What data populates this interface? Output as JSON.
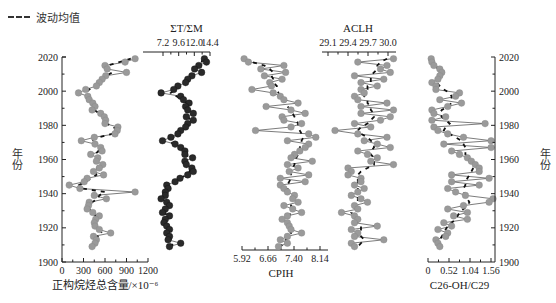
{
  "legend": {
    "label": "波动均值",
    "icon": "dashed-line-icon"
  },
  "y_axis": {
    "label": "年份",
    "ticks": [
      "2020",
      "2000",
      "1980",
      "1960",
      "1940",
      "1920",
      "1900"
    ]
  },
  "panels": [
    {
      "id": "p1",
      "xlabel": "正构烷烃总含量/×10⁻⁶",
      "ticks": [
        "0",
        "300",
        "600",
        "900",
        "1200"
      ],
      "axis_pos": "bottom",
      "color": "#9a9a9a"
    },
    {
      "id": "p2",
      "xlabel": "ΣT/ΣM",
      "ticks": [
        "7.2",
        "9.6",
        "12.0",
        "14.4"
      ],
      "axis_pos": "top",
      "color": "#2a2a2a"
    },
    {
      "id": "p3",
      "xlabel": "CPIH",
      "ticks": [
        "5.92",
        "6.66",
        "7.40",
        "8.14"
      ],
      "axis_pos": "bottom",
      "color": "#9a9a9a"
    },
    {
      "id": "p4",
      "xlabel": "ACLH",
      "ticks": [
        "29.1",
        "29.4",
        "29.7",
        "30.0"
      ],
      "axis_pos": "top",
      "color": "#9a9a9a"
    },
    {
      "id": "p5",
      "xlabel": "C26-OH/C29",
      "ticks": [
        "0",
        "0.52",
        "1.04",
        "1.56"
      ],
      "axis_pos": "bottom",
      "color": "#9a9a9a"
    }
  ],
  "chart_data": [
    {
      "type": "line",
      "title": "正构烷烃总含量",
      "xlabel": "正构烷烃总含量/×10⁻⁶",
      "ylabel": "年份",
      "xlim": [
        0,
        1200
      ],
      "ylim": [
        1900,
        2020
      ],
      "y": [
        2019,
        2017,
        2015,
        2013,
        2011,
        2009,
        2007,
        2005,
        2003,
        2001,
        1999,
        1997,
        1995,
        1993,
        1991,
        1989,
        1987,
        1985,
        1983,
        1981,
        1979,
        1977,
        1975,
        1973,
        1971,
        1969,
        1967,
        1965,
        1963,
        1961,
        1959,
        1957,
        1955,
        1953,
        1951,
        1949,
        1947,
        1945,
        1943,
        1941,
        1939,
        1937,
        1935,
        1933,
        1931,
        1929,
        1927,
        1925,
        1923,
        1921,
        1919,
        1917,
        1915,
        1913,
        1911,
        1909
      ],
      "values": [
        1020,
        880,
        600,
        630,
        900,
        610,
        560,
        520,
        480,
        330,
        230,
        360,
        380,
        430,
        460,
        420,
        540,
        590,
        610,
        600,
        780,
        770,
        740,
        450,
        270,
        460,
        540,
        560,
        400,
        500,
        480,
        570,
        520,
        440,
        580,
        350,
        310,
        100,
        250,
        1020,
        450,
        620,
        380,
        370,
        350,
        430,
        520,
        470,
        450,
        460,
        520,
        680,
        440,
        480,
        460,
        420
      ],
      "moving_average": [
        960,
        800,
        640,
        610,
        700,
        620,
        560,
        520,
        470,
        380,
        320,
        340,
        370,
        420,
        450,
        450,
        520,
        580,
        600,
        620,
        720,
        760,
        700,
        520,
        400,
        440,
        500,
        510,
        460,
        480,
        500,
        520,
        490,
        460,
        480,
        400,
        330,
        240,
        280,
        600,
        520,
        500,
        420,
        390,
        380,
        420,
        470,
        460,
        450,
        470,
        520,
        560,
        500,
        470,
        450,
        430
      ]
    },
    {
      "type": "line",
      "title": "ΣT/ΣM",
      "xlabel": "ΣT/ΣM",
      "ylabel": "年份",
      "xlim": [
        4.8,
        14.4
      ],
      "ylim": [
        1900,
        2020
      ],
      "y": [
        2019,
        2017,
        2015,
        2013,
        2011,
        2009,
        2007,
        2005,
        2003,
        2001,
        1999,
        1997,
        1995,
        1993,
        1991,
        1989,
        1987,
        1985,
        1983,
        1981,
        1979,
        1977,
        1975,
        1973,
        1971,
        1969,
        1967,
        1965,
        1963,
        1961,
        1959,
        1957,
        1955,
        1953,
        1951,
        1949,
        1947,
        1945,
        1943,
        1941,
        1939,
        1937,
        1935,
        1933,
        1931,
        1929,
        1927,
        1925,
        1923,
        1921,
        1919,
        1917,
        1915,
        1913,
        1911,
        1909
      ],
      "values": [
        13.6,
        13.9,
        12.8,
        12.2,
        13.2,
        11.8,
        11.2,
        10.9,
        9.8,
        9.2,
        7.4,
        10.2,
        10.6,
        11.4,
        10.9,
        11.2,
        12.0,
        11.0,
        12.0,
        11.2,
        10.9,
        10.2,
        9.8,
        8.8,
        7.6,
        9.4,
        10.2,
        10.8,
        10.8,
        11.9,
        10.8,
        11.0,
        11.8,
        12.0,
        11.2,
        10.1,
        9.4,
        8.2,
        8.4,
        8.0,
        8.0,
        7.4,
        8.2,
        8.6,
        8.0,
        7.6,
        8.6,
        8.0,
        7.8,
        8.2,
        8.6,
        8.2,
        8.6,
        8.4,
        10.2,
        8.6
      ],
      "moving_average": [
        13.4,
        13.2,
        12.8,
        12.4,
        12.4,
        11.8,
        11.2,
        10.8,
        10.0,
        9.4,
        8.8,
        9.6,
        10.4,
        11.0,
        11.0,
        11.2,
        11.5,
        11.3,
        11.5,
        11.1,
        10.8,
        10.2,
        9.7,
        9.1,
        8.6,
        9.1,
        9.9,
        10.5,
        10.9,
        11.2,
        11.0,
        11.1,
        11.5,
        11.5,
        11.0,
        10.1,
        9.4,
        8.7,
        8.4,
        8.2,
        8.0,
        7.9,
        8.1,
        8.3,
        8.1,
        8.0,
        8.2,
        8.1,
        8.0,
        8.2,
        8.4,
        8.4,
        8.5,
        8.8,
        9.2,
        8.8
      ]
    },
    {
      "type": "line",
      "title": "CPIH",
      "xlabel": "CPIH",
      "ylabel": "年份",
      "xlim": [
        5.92,
        8.4
      ],
      "ylim": [
        1900,
        2020
      ],
      "y": [
        2019,
        2017,
        2015,
        2013,
        2011,
        2009,
        2007,
        2005,
        2003,
        2001,
        1999,
        1997,
        1995,
        1993,
        1991,
        1989,
        1987,
        1985,
        1983,
        1981,
        1979,
        1977,
        1975,
        1973,
        1971,
        1969,
        1967,
        1965,
        1963,
        1961,
        1959,
        1957,
        1955,
        1953,
        1951,
        1949,
        1947,
        1945,
        1943,
        1941,
        1939,
        1937,
        1935,
        1933,
        1931,
        1929,
        1927,
        1925,
        1923,
        1921,
        1919,
        1917,
        1915,
        1913,
        1911,
        1909
      ],
      "values": [
        5.98,
        6.1,
        7.1,
        6.45,
        7.15,
        6.55,
        7.05,
        6.7,
        6.75,
        6.2,
        6.8,
        7.0,
        7.1,
        7.5,
        6.6,
        7.3,
        7.7,
        7.05,
        7.1,
        7.6,
        7.3,
        6.3,
        7.8,
        8.0,
        7.2,
        7.8,
        7.7,
        7.55,
        7.4,
        7.3,
        7.9,
        7.2,
        7.5,
        7.25,
        7.8,
        7.0,
        7.7,
        7.0,
        7.1,
        7.2,
        7.4,
        7.35,
        7.5,
        7.1,
        7.35,
        7.6,
        7.2,
        7.05,
        7.2,
        7.25,
        7.3,
        7.6,
        7.2,
        7.0,
        7.2,
        6.95
      ],
      "moving_average": [
        6.0,
        6.2,
        6.55,
        6.7,
        6.8,
        6.75,
        6.8,
        6.8,
        6.9,
        6.9,
        6.95,
        7.0,
        7.1,
        7.15,
        7.2,
        7.3,
        7.35,
        7.4,
        7.45,
        7.5,
        7.5,
        7.55,
        7.6,
        7.65,
        7.6,
        7.6,
        7.55,
        7.55,
        7.5,
        7.45,
        7.4,
        7.4,
        7.35,
        7.3,
        7.3,
        7.3,
        7.25,
        7.2,
        7.2,
        7.25,
        7.3,
        7.3,
        7.35,
        7.3,
        7.3,
        7.3,
        7.25,
        7.25,
        7.2,
        7.2,
        7.25,
        7.3,
        7.25,
        7.15,
        7.1,
        7.0
      ]
    },
    {
      "type": "line",
      "title": "ACLH",
      "xlabel": "ACLH",
      "ylabel": "年份",
      "xlim": [
        29.0,
        30.2
      ],
      "ylim": [
        1900,
        2020
      ],
      "y": [
        2019,
        2017,
        2015,
        2013,
        2011,
        2009,
        2007,
        2005,
        2003,
        2001,
        1999,
        1997,
        1995,
        1993,
        1991,
        1989,
        1987,
        1985,
        1983,
        1981,
        1979,
        1977,
        1975,
        1973,
        1971,
        1969,
        1967,
        1965,
        1963,
        1961,
        1959,
        1957,
        1955,
        1953,
        1951,
        1949,
        1947,
        1945,
        1943,
        1941,
        1939,
        1937,
        1935,
        1933,
        1931,
        1929,
        1927,
        1925,
        1923,
        1921,
        1919,
        1917,
        1915,
        1913,
        1911,
        1909
      ],
      "values": [
        30.1,
        29.55,
        30.0,
        29.9,
        30.05,
        29.5,
        29.95,
        29.6,
        29.85,
        29.6,
        29.65,
        29.5,
        29.55,
        30.0,
        29.6,
        30.1,
        29.6,
        30.05,
        29.9,
        29.5,
        29.75,
        29.2,
        29.55,
        30.0,
        29.65,
        29.85,
        30.05,
        29.55,
        29.7,
        29.85,
        29.75,
        30.1,
        29.4,
        29.45,
        29.4,
        29.6,
        29.6,
        29.5,
        29.65,
        29.55,
        29.45,
        29.6,
        29.7,
        29.5,
        29.55,
        29.3,
        29.5,
        29.55,
        29.5,
        29.85,
        29.45,
        29.55,
        29.5,
        29.95,
        29.45,
        29.5
      ],
      "moving_average": [
        30.0,
        29.9,
        29.85,
        29.85,
        29.8,
        29.75,
        29.75,
        29.75,
        29.7,
        29.7,
        29.65,
        29.65,
        29.7,
        29.7,
        29.75,
        29.75,
        29.8,
        29.8,
        29.75,
        29.7,
        29.6,
        29.55,
        29.6,
        29.7,
        29.75,
        29.8,
        29.8,
        29.75,
        29.75,
        29.8,
        29.8,
        29.8,
        29.7,
        29.6,
        29.55,
        29.55,
        29.55,
        29.55,
        29.55,
        29.55,
        29.55,
        29.55,
        29.55,
        29.5,
        29.5,
        29.45,
        29.5,
        29.5,
        29.55,
        29.6,
        29.6,
        29.6,
        29.6,
        29.65,
        29.6,
        29.55
      ]
    },
    {
      "type": "line",
      "title": "C26-OH/C29",
      "xlabel": "C26-OH/C29",
      "ylabel": "年份",
      "xlim": [
        0,
        1.7
      ],
      "ylim": [
        1900,
        2020
      ],
      "y": [
        2019,
        2017,
        2015,
        2013,
        2011,
        2009,
        2007,
        2005,
        2003,
        2001,
        1999,
        1997,
        1995,
        1993,
        1991,
        1989,
        1987,
        1985,
        1983,
        1981,
        1979,
        1977,
        1975,
        1973,
        1971,
        1969,
        1967,
        1965,
        1963,
        1961,
        1959,
        1957,
        1955,
        1953,
        1951,
        1949,
        1947,
        1945,
        1943,
        1941,
        1939,
        1937,
        1935,
        1933,
        1931,
        1929,
        1927,
        1925,
        1923,
        1921,
        1919,
        1917,
        1915,
        1913,
        1911,
        1909
      ],
      "values": [
        0.08,
        0.1,
        0.15,
        0.3,
        0.35,
        0.3,
        0.25,
        0.1,
        0.2,
        0.2,
        0.8,
        0.7,
        0.3,
        0.85,
        0.5,
        0.1,
        0.15,
        0.45,
        0.1,
        1.45,
        0.15,
        0.25,
        0.5,
        0.9,
        1.6,
        0.4,
        1.6,
        0.6,
        0.8,
        1.0,
        1.1,
        1.2,
        1.3,
        1.3,
        0.6,
        1.55,
        0.6,
        1.3,
        0.5,
        0.7,
        0.95,
        1.65,
        1.55,
        0.9,
        0.5,
        1.0,
        0.65,
        1.0,
        0.4,
        0.6,
        0.25,
        0.5,
        0.45,
        0.2,
        0.25,
        0.3
      ],
      "moving_average": [
        0.1,
        0.15,
        0.2,
        0.25,
        0.28,
        0.28,
        0.25,
        0.22,
        0.3,
        0.4,
        0.55,
        0.6,
        0.6,
        0.6,
        0.5,
        0.35,
        0.3,
        0.35,
        0.45,
        0.55,
        0.45,
        0.4,
        0.55,
        0.7,
        0.85,
        0.9,
        0.95,
        0.95,
        0.95,
        1.0,
        1.05,
        1.1,
        1.15,
        1.1,
        1.05,
        1.0,
        0.95,
        0.95,
        0.9,
        0.9,
        0.95,
        1.0,
        1.05,
        1.0,
        0.9,
        0.8,
        0.75,
        0.7,
        0.6,
        0.5,
        0.45,
        0.4,
        0.35,
        0.3,
        0.3,
        0.3
      ]
    }
  ]
}
